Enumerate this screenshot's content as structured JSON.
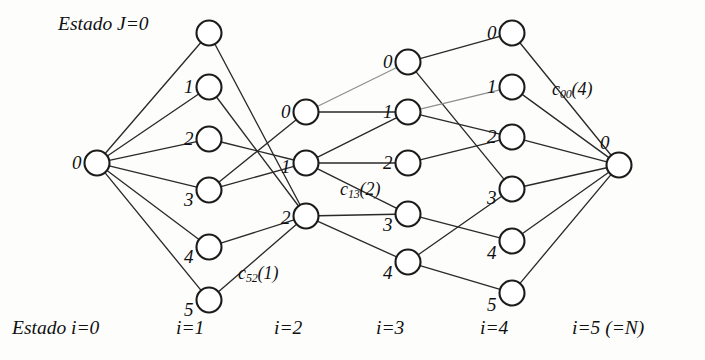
{
  "figure": {
    "type": "trellis-diagram",
    "title_caption_left": "Estado J=0",
    "bottom_caption_left": "Estado i=0",
    "stroke_color": "#2a2a2a",
    "node_fill": "#ffffff"
  },
  "columns": [
    {
      "id": "i0",
      "label": "i=0",
      "x": 97,
      "label_x": 28,
      "label_y": 323
    },
    {
      "id": "i1",
      "label": "i=1",
      "x": 209,
      "label_x": 176,
      "label_y": 323
    },
    {
      "id": "i2",
      "label": "i=2",
      "x": 306,
      "label_x": 274,
      "label_y": 323
    },
    {
      "id": "i3",
      "label": "i=3",
      "x": 408,
      "label_x": 376,
      "label_y": 323
    },
    {
      "id": "i4",
      "label": "i=4",
      "x": 512,
      "label_x": 480,
      "label_y": 323
    },
    {
      "id": "i5",
      "label": "i=5 (=N)",
      "x": 619,
      "label_x": 572,
      "label_y": 323
    }
  ],
  "nodes": [
    {
      "col": 0,
      "state": "0",
      "x": 97,
      "y": 163,
      "label": "0",
      "lx": 72,
      "ly": 153,
      "show_label": true
    },
    {
      "col": 1,
      "state": "0",
      "x": 209,
      "y": 33,
      "label": "0",
      "lx": 160,
      "ly": 22,
      "show_label": false
    },
    {
      "col": 1,
      "state": "1",
      "x": 209,
      "y": 87,
      "label": "1",
      "lx": 184,
      "ly": 77,
      "show_label": true
    },
    {
      "col": 1,
      "state": "2",
      "x": 209,
      "y": 139,
      "label": "2",
      "lx": 184,
      "ly": 129,
      "show_label": true
    },
    {
      "col": 1,
      "state": "3",
      "x": 209,
      "y": 190,
      "label": "3",
      "lx": 184,
      "ly": 190,
      "show_label": true
    },
    {
      "col": 1,
      "state": "4",
      "x": 209,
      "y": 247,
      "label": "4",
      "lx": 184,
      "ly": 247,
      "show_label": true
    },
    {
      "col": 1,
      "state": "5",
      "x": 209,
      "y": 300,
      "label": "5",
      "lx": 184,
      "ly": 300,
      "show_label": true
    },
    {
      "col": 2,
      "state": "0",
      "x": 306,
      "y": 112,
      "label": "0",
      "lx": 281,
      "ly": 102,
      "show_label": true
    },
    {
      "col": 2,
      "state": "1",
      "x": 306,
      "y": 163,
      "label": "1",
      "lx": 281,
      "ly": 157,
      "show_label": true
    },
    {
      "col": 2,
      "state": "2",
      "x": 306,
      "y": 216,
      "label": "2",
      "lx": 281,
      "ly": 208,
      "show_label": true
    },
    {
      "col": 3,
      "state": "0",
      "x": 408,
      "y": 62,
      "label": "0",
      "lx": 383,
      "ly": 52,
      "show_label": true
    },
    {
      "col": 3,
      "state": "1",
      "x": 408,
      "y": 112,
      "label": "1",
      "lx": 383,
      "ly": 102,
      "show_label": true
    },
    {
      "col": 3,
      "state": "2",
      "x": 408,
      "y": 163,
      "label": "2",
      "lx": 383,
      "ly": 153,
      "show_label": true
    },
    {
      "col": 3,
      "state": "3",
      "x": 408,
      "y": 214,
      "label": "3",
      "lx": 383,
      "ly": 215,
      "show_label": true
    },
    {
      "col": 3,
      "state": "4",
      "x": 408,
      "y": 262,
      "label": "4",
      "lx": 383,
      "ly": 263,
      "show_label": true
    },
    {
      "col": 4,
      "state": "0",
      "x": 512,
      "y": 33,
      "label": "0",
      "lx": 487,
      "ly": 23,
      "show_label": true
    },
    {
      "col": 4,
      "state": "1",
      "x": 512,
      "y": 87,
      "label": "1",
      "lx": 487,
      "ly": 77,
      "show_label": true
    },
    {
      "col": 4,
      "state": "2",
      "x": 512,
      "y": 137,
      "label": "2",
      "lx": 487,
      "ly": 127,
      "show_label": true
    },
    {
      "col": 4,
      "state": "3",
      "x": 512,
      "y": 189,
      "label": "3",
      "lx": 487,
      "ly": 188,
      "show_label": true
    },
    {
      "col": 4,
      "state": "4",
      "x": 512,
      "y": 241,
      "label": "4",
      "lx": 487,
      "ly": 243,
      "show_label": true
    },
    {
      "col": 4,
      "state": "5",
      "x": 512,
      "y": 293,
      "label": "5",
      "lx": 487,
      "ly": 295,
      "show_label": true
    },
    {
      "col": 5,
      "state": "0",
      "x": 619,
      "y": 165,
      "label": "0",
      "lx": 600,
      "ly": 133,
      "show_label": true
    }
  ],
  "extra_node_labels": [
    {
      "name": "node-label-i1-0",
      "text": "Estado J=0",
      "x": 58,
      "y": 22,
      "kind": "caption"
    }
  ],
  "edges": [
    {
      "from": [
        0,
        0
      ],
      "to": [
        1,
        0
      ],
      "faint": false
    },
    {
      "from": [
        0,
        0
      ],
      "to": [
        1,
        1
      ],
      "faint": false
    },
    {
      "from": [
        0,
        0
      ],
      "to": [
        1,
        2
      ],
      "faint": false
    },
    {
      "from": [
        0,
        0
      ],
      "to": [
        1,
        3
      ],
      "faint": false
    },
    {
      "from": [
        0,
        0
      ],
      "to": [
        1,
        4
      ],
      "faint": false
    },
    {
      "from": [
        0,
        0
      ],
      "to": [
        1,
        5
      ],
      "faint": false
    },
    {
      "from": [
        1,
        0
      ],
      "to": [
        2,
        2
      ],
      "faint": false
    },
    {
      "from": [
        1,
        1
      ],
      "to": [
        2,
        2
      ],
      "faint": false
    },
    {
      "from": [
        1,
        2
      ],
      "to": [
        2,
        1
      ],
      "faint": false
    },
    {
      "from": [
        1,
        3
      ],
      "to": [
        2,
        0
      ],
      "faint": false
    },
    {
      "from": [
        1,
        3
      ],
      "to": [
        2,
        1
      ],
      "faint": false
    },
    {
      "from": [
        1,
        4
      ],
      "to": [
        2,
        2
      ],
      "faint": false
    },
    {
      "from": [
        1,
        5
      ],
      "to": [
        2,
        2
      ],
      "faint": false
    },
    {
      "from": [
        2,
        0
      ],
      "to": [
        3,
        0
      ],
      "faint": true
    },
    {
      "from": [
        2,
        0
      ],
      "to": [
        3,
        1
      ],
      "faint": false
    },
    {
      "from": [
        2,
        1
      ],
      "to": [
        3,
        1
      ],
      "faint": false
    },
    {
      "from": [
        2,
        1
      ],
      "to": [
        3,
        2
      ],
      "faint": false
    },
    {
      "from": [
        2,
        1
      ],
      "to": [
        3,
        3
      ],
      "faint": false
    },
    {
      "from": [
        2,
        2
      ],
      "to": [
        3,
        3
      ],
      "faint": false
    },
    {
      "from": [
        2,
        2
      ],
      "to": [
        3,
        4
      ],
      "faint": false
    },
    {
      "from": [
        3,
        0
      ],
      "to": [
        4,
        0
      ],
      "faint": false
    },
    {
      "from": [
        3,
        0
      ],
      "to": [
        4,
        3
      ],
      "faint": false
    },
    {
      "from": [
        3,
        1
      ],
      "to": [
        4,
        1
      ],
      "faint": true
    },
    {
      "from": [
        3,
        1
      ],
      "to": [
        4,
        2
      ],
      "faint": false
    },
    {
      "from": [
        3,
        2
      ],
      "to": [
        4,
        2
      ],
      "faint": false
    },
    {
      "from": [
        3,
        3
      ],
      "to": [
        4,
        4
      ],
      "faint": false
    },
    {
      "from": [
        3,
        4
      ],
      "to": [
        4,
        3
      ],
      "faint": false
    },
    {
      "from": [
        3,
        4
      ],
      "to": [
        4,
        5
      ],
      "faint": false
    },
    {
      "from": [
        4,
        0
      ],
      "to": [
        5,
        0
      ],
      "faint": false
    },
    {
      "from": [
        4,
        1
      ],
      "to": [
        5,
        0
      ],
      "faint": false
    },
    {
      "from": [
        4,
        2
      ],
      "to": [
        5,
        0
      ],
      "faint": false
    },
    {
      "from": [
        4,
        3
      ],
      "to": [
        5,
        0
      ],
      "faint": false
    },
    {
      "from": [
        4,
        4
      ],
      "to": [
        5,
        0
      ],
      "faint": false
    },
    {
      "from": [
        4,
        5
      ],
      "to": [
        5,
        0
      ],
      "faint": false
    }
  ],
  "cost_labels": [
    {
      "name": "cost-label-c52-1",
      "base": "c",
      "sub": "52",
      "suffix": "(1)",
      "x": 238,
      "y": 264
    },
    {
      "name": "cost-label-c13-2",
      "base": "c",
      "sub": "13",
      "suffix": "(2)",
      "x": 340,
      "y": 180
    },
    {
      "name": "cost-label-c00-4",
      "base": "c",
      "sub": "00",
      "suffix": "(4)",
      "x": 552,
      "y": 80
    }
  ],
  "node_radius": 12.5
}
